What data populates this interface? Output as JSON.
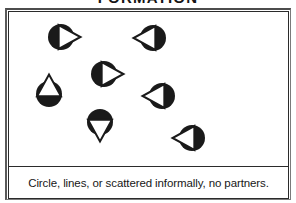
{
  "diagram": {
    "title": "FORMATION",
    "caption": "Circle, lines, or scattered informally, no partners.",
    "colors": {
      "ink": "#1a1a1a",
      "paper": "#ffffff",
      "frame_outer": "#4c4c4c",
      "frame_inner": "#2b2b2b"
    },
    "legend": {
      "marker_meaning": "dancer token: filled circle body with open triangle indicating facing direction"
    },
    "dancers": [
      {
        "id": "dancer-1",
        "label": "top-left dancer",
        "x": 52,
        "y": 25,
        "r": 13,
        "facing": "right"
      },
      {
        "id": "dancer-2",
        "label": "top-right dancer",
        "x": 144,
        "y": 26,
        "r": 13,
        "facing": "left"
      },
      {
        "id": "dancer-3",
        "label": "center dancer",
        "x": 95,
        "y": 62,
        "r": 13,
        "facing": "right"
      },
      {
        "id": "dancer-4",
        "label": "left dancer",
        "x": 40,
        "y": 82,
        "r": 13,
        "facing": "up"
      },
      {
        "id": "dancer-5",
        "label": "right dancer",
        "x": 153,
        "y": 84,
        "r": 13,
        "facing": "left"
      },
      {
        "id": "dancer-6",
        "label": "bottom-center dancer",
        "x": 91,
        "y": 110,
        "r": 13,
        "facing": "down"
      },
      {
        "id": "dancer-7",
        "label": "bottom-right dancer",
        "x": 183,
        "y": 126,
        "r": 13,
        "facing": "left"
      }
    ],
    "dancer_count": 7
  }
}
